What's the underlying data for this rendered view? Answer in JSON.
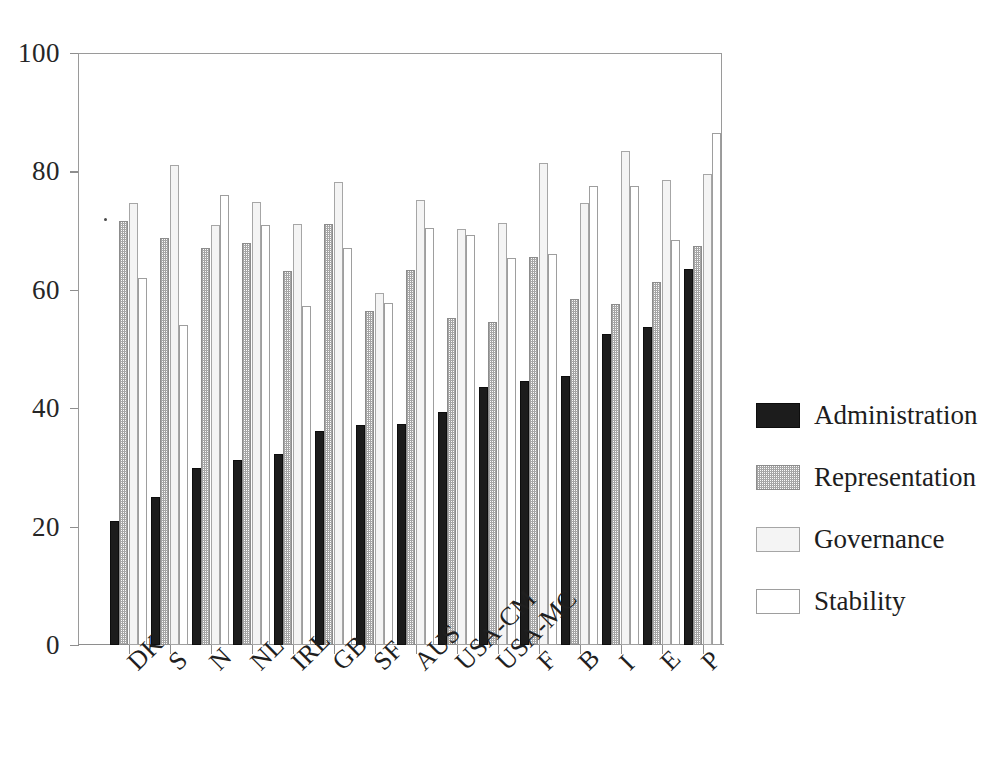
{
  "chart_data": {
    "type": "bar",
    "title": "",
    "subtitle": "",
    "xlabel": "",
    "ylabel": "",
    "ylim": [
      0,
      100
    ],
    "yticks": [
      0,
      20,
      40,
      60,
      80,
      100
    ],
    "grid": false,
    "legend_position": "right",
    "orientation": "vertical",
    "categories": [
      "DK",
      "S",
      "N",
      "NL",
      "IRL",
      "GB",
      "SF",
      "AUS",
      "USA-CM",
      "USA-MC",
      "F",
      "B",
      "I",
      "E",
      "P"
    ],
    "series": [
      {
        "name": "Administration",
        "color": "#1c1c1c",
        "values": [
          20.9,
          25.0,
          29.9,
          31.2,
          32.2,
          36.2,
          37.2,
          37.3,
          39.4,
          43.5,
          44.6,
          45.5,
          52.5,
          53.7,
          63.6
        ]
      },
      {
        "name": "Representation",
        "color": "#bdbdbd",
        "values": [
          71.6,
          68.8,
          67.1,
          67.9,
          63.1,
          71.1,
          56.4,
          63.3,
          55.3,
          54.5,
          65.5,
          58.5,
          57.6,
          61.4,
          67.4
        ]
      },
      {
        "name": "Governance",
        "color": "#f0f0f0",
        "values": [
          74.7,
          81.0,
          71.0,
          74.8,
          71.1,
          78.2,
          59.4,
          75.1,
          70.2,
          71.3,
          81.4,
          74.6,
          83.5,
          78.6,
          79.6
        ]
      },
      {
        "name": "Stability",
        "color": "#ffffff",
        "values": [
          62.0,
          54.0,
          76.0,
          71.0,
          57.3,
          67.0,
          57.8,
          70.5,
          69.2,
          65.3,
          66.0,
          77.5,
          77.5,
          68.4,
          86.5
        ]
      }
    ]
  },
  "legend": {
    "items": [
      {
        "label": "Administration",
        "swatch": "administration"
      },
      {
        "label": "Representation",
        "swatch": "representation"
      },
      {
        "label": "Governance",
        "swatch": "governance"
      },
      {
        "label": "Stability",
        "swatch": "stability"
      }
    ]
  }
}
